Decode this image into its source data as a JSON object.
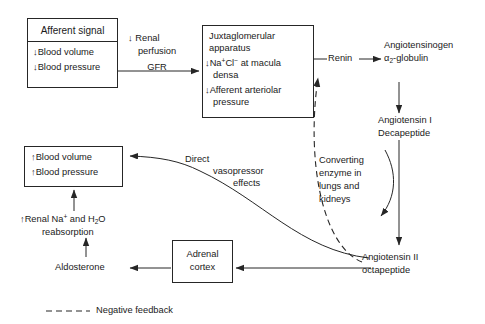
{
  "diagram": {
    "boxes": {
      "afferent_signal": {
        "header": "Afferent signal",
        "line1": "Blood volume",
        "line2": "Blood pressure",
        "arrow1": "↓",
        "arrow2": "↓"
      },
      "jga": {
        "title_line1": "Juxtaglomerular",
        "title_line2": "apparatus",
        "item1_arrow": "↓",
        "item1_a": "Na",
        "item1_sup_a": "+",
        "item1_b": "Cl",
        "item1_sup_b": "−",
        "item1_c": " at macula",
        "item1_d": "densa",
        "item2_arrow": "↓",
        "item2_a": "Afferent arteriolar",
        "item2_b": "pressure"
      },
      "blood_output": {
        "arrow1": "↑",
        "line1": "Blood volume",
        "arrow2": "↑",
        "line2": "Blood pressure"
      },
      "adrenal_cortex": {
        "line1": "Adrenal",
        "line2": "cortex"
      }
    },
    "nodes": {
      "renin": "Renin",
      "angiotensinogen_l1": "Angiotensinogen",
      "angiotensinogen_l2_a": "α",
      "angiotensinogen_l2_sub": "2",
      "angiotensinogen_l2_b": "-globulin",
      "angiotensin_i_l1": "Angiotensin I",
      "angiotensin_i_l2": "Decapeptide",
      "angiotensin_ii_l1": "Angiotensin II",
      "angiotensin_ii_l2": "octapeptide",
      "aldosterone": "Aldosterone",
      "renal_reabsorption_arrow": "↑",
      "renal_reabsorption_l1_a": "Renal Na",
      "renal_reabsorption_l1_sup": "+",
      "renal_reabsorption_l1_b": " and H",
      "renal_reabsorption_l1_sub": "2",
      "renal_reabsorption_l1_c": "O",
      "renal_reabsorption_l2": "reabsorption"
    },
    "edge_labels": {
      "renal_perfusion_arrow": "↓",
      "renal_perfusion_l1": "Renal",
      "renal_perfusion_l2": "perfusion",
      "renal_perfusion_l3": "GFR",
      "converting_enzyme_l1": "Converting",
      "converting_enzyme_l2": "enzyme in",
      "converting_enzyme_l3": "lungs and",
      "converting_enzyme_l4": "kidneys",
      "vasopressor_l1": "Direct",
      "vasopressor_l2": "vasopressor",
      "vasopressor_l3": "effects"
    },
    "legend": {
      "label": "Negative feedback",
      "dash_pattern": "6,4"
    },
    "colors": {
      "line": "#262626",
      "text": "#1a1a1a",
      "background": "#ffffff"
    }
  }
}
